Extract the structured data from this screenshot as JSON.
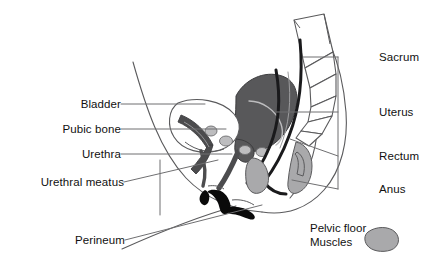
{
  "diagram": {
    "labels_left": [
      {
        "id": "bladder",
        "text": "Bladder",
        "x": 62,
        "y": 98,
        "lx1": 121,
        "ly1": 104,
        "lx2": 205,
        "ly2": 104
      },
      {
        "id": "pubic-bone",
        "text": "Pubic bone",
        "x": 41,
        "y": 123,
        "lx1": 121,
        "ly1": 129,
        "lx2": 226,
        "ly2": 129
      },
      {
        "id": "urethra",
        "text": "Urethra",
        "x": 66,
        "y": 148,
        "lx1": 121,
        "ly1": 154,
        "lx2": 232,
        "ly2": 154
      },
      {
        "id": "urethral-meatus",
        "text": "Urethral meatus",
        "x": 17,
        "y": 176,
        "lx1": 124,
        "ly1": 182,
        "lx2": 218,
        "ly2": 160
      },
      {
        "id": "perineum",
        "text": "Perineum",
        "x": 57,
        "y": 234,
        "lx1": 125,
        "ly1": 240,
        "lx2": 262,
        "ly2": 205
      }
    ],
    "labels_right": [
      {
        "id": "sacrum",
        "text": "Sacrum",
        "x": 379,
        "y": 51,
        "lx1": 338,
        "ly1": 57,
        "lx2": 303,
        "ly2": 57
      },
      {
        "id": "uterus",
        "text": "Uterus",
        "x": 379,
        "y": 106,
        "lx1": 338,
        "ly1": 112,
        "lx2": 276,
        "ly2": 112
      },
      {
        "id": "rectum",
        "text": "Rectum",
        "x": 379,
        "y": 150,
        "lx1": 338,
        "ly1": 156,
        "lx2": 290,
        "ly2": 139
      },
      {
        "id": "anus",
        "text": "Anus",
        "x": 379,
        "y": 183,
        "lx1": 338,
        "ly1": 189,
        "lx2": 292,
        "ly2": 180
      }
    ],
    "legend": {
      "line1": "Pelvic floor",
      "line2": "Muscles",
      "swatch_color": "#a9a9ab",
      "x": 310,
      "y": 221
    },
    "colors": {
      "outline": "#5a5a5c",
      "dark_organ": "#58585a",
      "mid_gray": "#6d6d6f",
      "light_muscle": "#a9a9ab",
      "pale_gray": "#c9c9cb",
      "black": "#0a0a0a",
      "leader": "#6f6f71",
      "text": "#111111",
      "background": "#ffffff"
    }
  }
}
